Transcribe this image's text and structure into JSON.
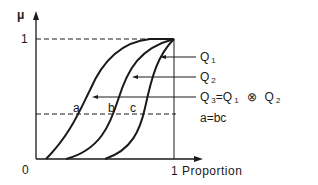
{
  "diagram": {
    "y_axis_label": "μ",
    "y_tick_top": "1",
    "origin_label": "0",
    "x_axis_label": "1 Proportion",
    "curves": [
      {
        "name": "Q",
        "sub": "1"
      },
      {
        "name": "Q",
        "sub": "2"
      },
      {
        "name": "Q",
        "sub": "3",
        "equation": "=Q",
        "eq_sub": "1",
        "operator": "⊗",
        "operand": "Q",
        "operand_sub": "2"
      }
    ],
    "relation": "a=bc",
    "points": {
      "a": "a",
      "b": "b",
      "c": "c"
    }
  }
}
